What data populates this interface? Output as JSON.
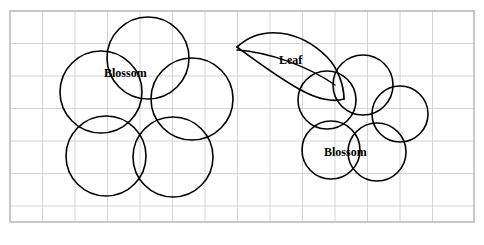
{
  "canvas": {
    "width": 484,
    "height": 245,
    "background": "#ffffff"
  },
  "grid": {
    "x": 10,
    "y": 11,
    "width": 464,
    "height": 211,
    "border_color": "#c8c8c8",
    "line_color": "#d4d4d4",
    "border_width": 2,
    "line_width": 1,
    "cell_size": 32.5,
    "v_lines": [
      42.5,
      75,
      107.5,
      140,
      172.5,
      205,
      237.5,
      270,
      302.5,
      335,
      367.5,
      400,
      432.5
    ],
    "h_lines": [
      43.5,
      76,
      108.5,
      141,
      173.5,
      206
    ]
  },
  "stroke": {
    "color": "#000000",
    "width": 1.6,
    "fill": "none"
  },
  "figure": {
    "name": "cherry-blossom-sketch",
    "left_blossom": {
      "name": "left-blossom",
      "center": {
        "x": 143,
        "y": 110
      },
      "petal_radius": 40,
      "ring_radius": 41,
      "petals": [
        {
          "cx": 148,
          "cy": 58,
          "r": 41
        },
        {
          "cx": 192,
          "cy": 99,
          "r": 41
        },
        {
          "cx": 173,
          "cy": 157,
          "r": 40
        },
        {
          "cx": 106,
          "cy": 156,
          "r": 40
        },
        {
          "cx": 101,
          "cy": 92,
          "r": 41
        }
      ]
    },
    "right_blossom": {
      "name": "right-blossom",
      "center": {
        "x": 362,
        "y": 116
      },
      "petal_radius": 30,
      "petals": [
        {
          "cx": 363,
          "cy": 85,
          "r": 30
        },
        {
          "cx": 400,
          "cy": 114,
          "r": 28
        },
        {
          "cx": 377,
          "cy": 152,
          "r": 29
        },
        {
          "cx": 331,
          "cy": 150,
          "r": 29
        },
        {
          "cx": 327,
          "cy": 100,
          "r": 29
        }
      ]
    },
    "leaf": {
      "name": "leaf",
      "tip": {
        "x": 237,
        "y": 47
      },
      "base": {
        "x": 344,
        "y": 99
      },
      "upper_curve": "M237,47 C262,24 300,30 327,57 C338,68 344,86 344,99",
      "lower_curve": "M237,47 C252,58 276,76 299,89 C318,100 334,102 344,99",
      "midrib": "M237,50 C268,52 308,66 335,85"
    }
  },
  "labels": [
    {
      "name": "label-left-blossom",
      "text": "Blossom",
      "x": 104,
      "y": 66,
      "size": 12
    },
    {
      "name": "label-leaf",
      "text": "Leaf",
      "x": 279,
      "y": 53,
      "size": 12
    },
    {
      "name": "label-right-blossom",
      "text": "Blossom",
      "x": 324,
      "y": 145,
      "size": 12
    }
  ]
}
